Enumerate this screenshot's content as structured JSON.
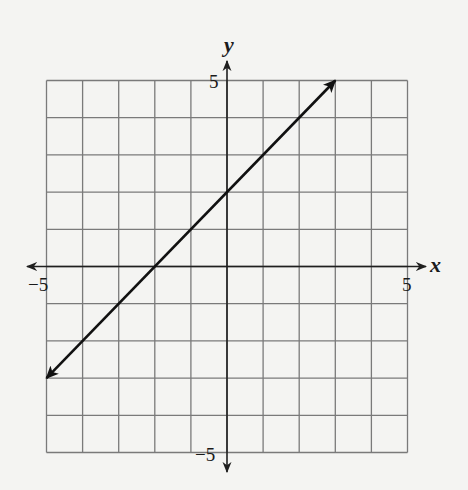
{
  "chart_data": {
    "type": "line",
    "title": "",
    "xlabel": "x",
    "ylabel": "y",
    "xlim": [
      -5,
      5
    ],
    "ylim": [
      -5,
      5
    ],
    "grid": true,
    "grid_step": 1,
    "x_tick_labels": [
      {
        "value": -5,
        "label": "−5"
      },
      {
        "value": 5,
        "label": "5"
      }
    ],
    "y_tick_labels": [
      {
        "value": 5,
        "label": "5"
      },
      {
        "value": -5,
        "label": "−5"
      }
    ],
    "series": [
      {
        "name": "y = x + 2",
        "equation": "y = x + 2",
        "slope": 1,
        "intercept": 2,
        "x": [
          -5,
          -2,
          0,
          3
        ],
        "y": [
          -3,
          0,
          2,
          5
        ],
        "arrows_both_ends": true
      }
    ],
    "legend": null
  },
  "colors": {
    "background": "#f4f4f2",
    "grid": "#7a7a7a",
    "axes": "#1f1f1f",
    "line": "#111111"
  },
  "labels": {
    "x_axis": "x",
    "y_axis": "y",
    "x_min": "−5",
    "x_max": "5",
    "y_max": "5",
    "y_min": "−5"
  }
}
